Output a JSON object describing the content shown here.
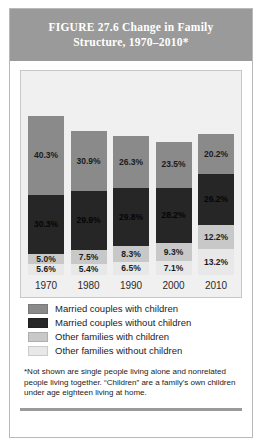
{
  "figure": {
    "title_line1": "FIGURE 27.6    Change in Family",
    "title_line2": "Structure, 1970–2010*",
    "footnote": "*Not shown are single people living alone and nonrelated people living together. “Children” are a family's own children under age eighteen living at home."
  },
  "legend": {
    "items": [
      {
        "label": "Married couples with children",
        "color": "#8a8a8a"
      },
      {
        "label": "Married couples without children",
        "color": "#262626"
      },
      {
        "label": "Other families with children",
        "color": "#c8c8c8"
      },
      {
        "label": "Other families without children",
        "color": "#e8e8e8"
      }
    ]
  },
  "chart_data": {
    "type": "bar",
    "stacked": true,
    "title": "FIGURE 27.6    Change in Family Structure, 1970–2010*",
    "xlabel": "",
    "ylabel": "",
    "ylim": [
      0,
      100
    ],
    "grid": false,
    "legend_position": "below",
    "categories": [
      "1970",
      "1980",
      "1990",
      "2000",
      "2010"
    ],
    "series": [
      {
        "name": "Married couples with children",
        "color": "#8a8a8a",
        "values": [
          40.3,
          30.9,
          26.3,
          23.5,
          20.2
        ]
      },
      {
        "name": "Married couples without children",
        "color": "#262626",
        "values": [
          30.3,
          29.9,
          29.8,
          28.2,
          26.2
        ]
      },
      {
        "name": "Other families with children",
        "color": "#c8c8c8",
        "values": [
          5.0,
          7.5,
          8.3,
          9.3,
          12.2
        ]
      },
      {
        "name": "Other families without children",
        "color": "#e8e8e8",
        "values": [
          5.6,
          5.4,
          6.5,
          7.1,
          13.2
        ]
      }
    ],
    "labels": {
      "1970": [
        "40.3%",
        "30.3%",
        "5.0%",
        "5.6%"
      ],
      "1980": [
        "30.9%",
        "29.9%",
        "7.5%",
        "5.4%"
      ],
      "1990": [
        "26.3%",
        "29.8%",
        "8.3%",
        "6.5%"
      ],
      "2000": [
        "23.5%",
        "28.2%",
        "9.3%",
        "7.1%"
      ],
      "2010": [
        "20.2%",
        "26.2%",
        "12.2%",
        "13.2%"
      ]
    }
  }
}
